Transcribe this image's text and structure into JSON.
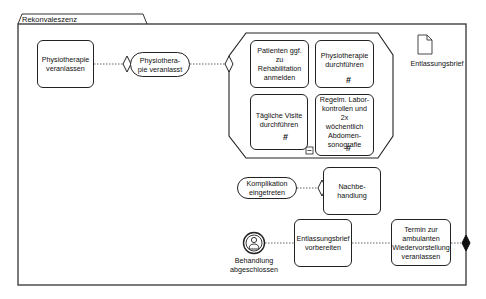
{
  "frame": {
    "title": "Rekonvaleszenz"
  },
  "nodes": {
    "physio_veranlassen": "Physiotherapie\nveranlassen",
    "patient_reha": "Patienten ggf. zu\nRehabilitation\nanmelden",
    "physio_durchfuehren": "Physiotherapie\ndurchführen",
    "visite": "Tägliche Visite\ndurchführen",
    "labor": "Regelm. Labor-\nkontrollen und 2x\nwöchentlich\nAbdomen-\nsonografie",
    "nachbehandlung": "Nachbe-\nhandlung",
    "entlassungsbrief_vorbereiten": "Entlassungsbrief\nvorbereiten",
    "termin": "Termin zur\nambulanten\nWiedervorstellung\nveranlassen"
  },
  "events": {
    "physio_veranlasst": "Physiothera-\npie veranlasst",
    "komplikation": "Komplikation\neingetreten"
  },
  "labels": {
    "document": "Entlassungsbrief",
    "end_event": "Behandlung\nabgeschlossen"
  },
  "markers": {
    "loop": "#",
    "collapse": "−"
  },
  "colors": {
    "stroke": "#222222",
    "background": "#ffffff"
  }
}
